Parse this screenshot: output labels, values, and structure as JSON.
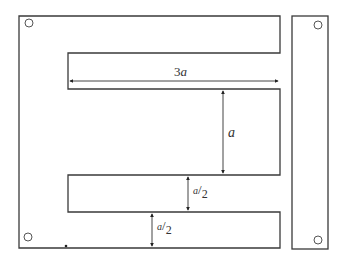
{
  "diagram": {
    "colors": {
      "stroke": "#3a3a3a",
      "background": "#ffffff"
    },
    "parts": [
      {
        "name": "E-core",
        "description": "E-shaped lamination with three arms and two slots"
      },
      {
        "name": "I-bar",
        "description": "Rectangular I-shaped closing bar"
      }
    ],
    "dimensions": [
      {
        "id": "slot-length",
        "label_coef": "3",
        "label_var": "a",
        "text": "3a",
        "orientation": "horizontal"
      },
      {
        "id": "middle-arm-height",
        "label_var": "a",
        "text": "a",
        "orientation": "vertical"
      },
      {
        "id": "slot-width",
        "label_num": "a",
        "label_den": "2",
        "text": "a/2",
        "orientation": "vertical"
      },
      {
        "id": "outer-arm-width",
        "label_num": "a",
        "label_den": "2",
        "text": "a/2",
        "orientation": "vertical"
      }
    ],
    "holes": 4
  }
}
